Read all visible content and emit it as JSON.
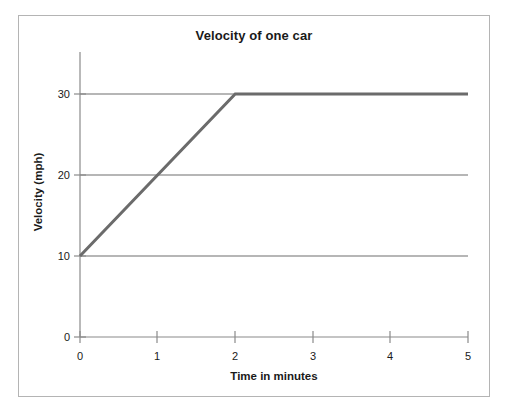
{
  "figure": {
    "title": "Velocity of one car",
    "background_color": "#ffffff",
    "frame_color": "#b4b4b4"
  },
  "axes": {
    "x_title": "Time in minutes",
    "y_title": "Velocity (mph)",
    "x_ticks": [
      "0",
      "1",
      "2",
      "3",
      "4",
      "5"
    ],
    "y_ticks": [
      "0",
      "10",
      "20",
      "30"
    ]
  },
  "chart_data": {
    "type": "line",
    "title": "Velocity of one car",
    "xlabel": "Time in minutes",
    "ylabel": "Velocity (mph)",
    "xlim": [
      0,
      5
    ],
    "ylim": [
      0,
      30
    ],
    "xticks": [
      0,
      1,
      2,
      3,
      4,
      5
    ],
    "yticks": [
      0,
      10,
      20,
      30
    ],
    "grid": "horizontal",
    "gridlines_y": [
      10,
      20,
      30
    ],
    "legend": null,
    "series": [
      {
        "name": "Velocity of one car",
        "color": "#6b6b6b",
        "line_width": 3,
        "x": [
          0,
          2,
          5
        ],
        "values": [
          10,
          30,
          30
        ],
        "points": [
          {
            "x": 0,
            "y": 10
          },
          {
            "x": 1,
            "y": 20
          },
          {
            "x": 2,
            "y": 30
          },
          {
            "x": 3,
            "y": 30
          },
          {
            "x": 4,
            "y": 30
          },
          {
            "x": 5,
            "y": 30
          }
        ]
      }
    ]
  }
}
